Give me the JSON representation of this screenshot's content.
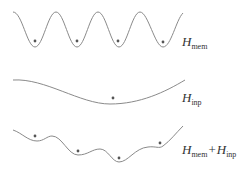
{
  "diagram": {
    "curves": [
      {
        "id": "mem",
        "label_main": "H",
        "label_sub": "mem",
        "path": "M13,12 C22,12 27,47 35,47 C43,47 48,12 56,12 C64,12 69,47 77,47 C85,47 90,12 98,12 C106,12 111,47 119,47 C127,47 132,12 140,12 C148,12 155,47 163,47 C171,47 176,20 183,13",
        "minima_dots": [
          [
            35,
            41
          ],
          [
            77,
            41
          ],
          [
            118,
            41
          ],
          [
            163,
            42
          ]
        ],
        "label_pos": [
          182,
          34
        ]
      },
      {
        "id": "inp",
        "label_main": "H",
        "label_sub": "inp",
        "path": "M13,80 C45,78 80,104 110,104 C140,104 165,92 185,80",
        "minima_dots": [
          [
            113,
            98
          ]
        ],
        "label_pos": [
          182,
          90
        ]
      },
      {
        "id": "sum",
        "label_main": "H",
        "label_sub": "mem",
        "label_plus": "+",
        "label_main2": "H",
        "label_sub2": "inp",
        "path": "M13,130 C22,133 28,141 37,141 C44,141 47,136 52,136 C62,136 68,155 78,155 C88,155 92,149 100,149 C108,149 112,162 119,162 C128,162 135,148 148,147 C156,146 159,149 163,146 C170,141 176,133 183,126",
        "minima_dots": [
          [
            35,
            136
          ],
          [
            78,
            151
          ],
          [
            119,
            158
          ],
          [
            160,
            143
          ]
        ],
        "label_pos": [
          182,
          142
        ]
      }
    ],
    "stroke_color": "#8a8a8a",
    "dot_color": "#555555"
  }
}
